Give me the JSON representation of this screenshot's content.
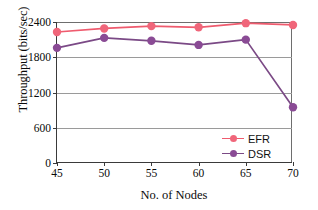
{
  "chart_data": {
    "type": "line",
    "title": "",
    "xlabel": "No. of Nodes",
    "ylabel": "Throughput (bits/sec)",
    "x": [
      45,
      50,
      55,
      60,
      65,
      70
    ],
    "xtick_labels": [
      "45",
      "50",
      "55",
      "60",
      "65",
      "70"
    ],
    "ytick_labels": [
      "0",
      "600",
      "1200",
      "1800",
      "2400"
    ],
    "yticks": [
      0,
      600,
      1200,
      1800,
      2400
    ],
    "xlim": [
      45,
      70
    ],
    "ylim": [
      0,
      2400
    ],
    "grid": "horizontal",
    "legend_position": "lower-right",
    "series": [
      {
        "name": "EFR",
        "color": "#ef5b6e",
        "marker_color": "#f0667a",
        "values": [
          2230,
          2290,
          2330,
          2310,
          2380,
          2350
        ]
      },
      {
        "name": "DSR",
        "color": "#7b4a86",
        "marker_color": "#8a4b95",
        "values": [
          1960,
          2130,
          2080,
          2010,
          2100,
          950
        ]
      }
    ]
  },
  "axis": {
    "line_color": "#3a3a3a",
    "grid_color": "#9a9a9a"
  },
  "legend": {
    "entries": [
      {
        "label": "EFR"
      },
      {
        "label": "DSR"
      }
    ]
  }
}
